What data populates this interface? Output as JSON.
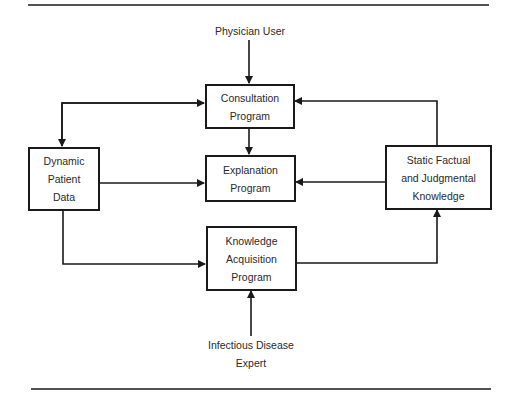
{
  "diagram": {
    "inputs": {
      "top": "Physician User",
      "bottom": [
        "Infectious Disease",
        "Expert"
      ]
    },
    "boxes": {
      "consultation": [
        "Consultation",
        "Program"
      ],
      "explanation": [
        "Explanation",
        "Program"
      ],
      "acquisition": [
        "Knowledge",
        "Acquisition",
        "Program"
      ],
      "patient_data": [
        "Dynamic",
        "Patient",
        "Data"
      ],
      "knowledge_base": [
        "Static Factual",
        "and Judgmental",
        "Knowledge"
      ]
    },
    "colors": {
      "line": "#1a1a1a",
      "background": "#ffffff"
    }
  }
}
